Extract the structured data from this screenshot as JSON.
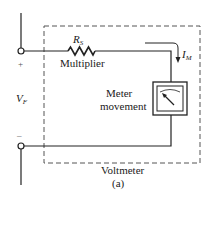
{
  "diagram": {
    "type": "circuit",
    "title": "Voltmeter",
    "caption": "(a)",
    "components": {
      "resistor": {
        "symbol": "R",
        "subscript": "S",
        "label": "Multiplier"
      },
      "meter": {
        "label_line1": "Meter",
        "label_line2": "movement"
      },
      "current": {
        "symbol": "I",
        "subscript": "M"
      },
      "voltage": {
        "symbol": "V",
        "subscript": "F"
      },
      "terminals": {
        "positive": "+",
        "negative": "–"
      }
    },
    "colors": {
      "wire": "#222222",
      "dashed_box": "#555555",
      "background": "#ffffff"
    }
  }
}
